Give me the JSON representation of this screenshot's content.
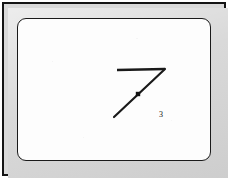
{
  "figure": {
    "kind": "line-diagram",
    "panel_background": "#fdfdfd",
    "frame_color": "#d7d7d7",
    "ink_color": "#1a1a1a",
    "point_label": "3",
    "strokes": [
      {
        "name": "top-horizontal-stroke",
        "from": [
          99,
          51
        ],
        "to": [
          147,
          50
        ],
        "width": 2.6
      },
      {
        "name": "main-diagonal-stroke",
        "from": [
          147,
          50
        ],
        "to": [
          96,
          98
        ],
        "width": 2.2
      }
    ],
    "marker": {
      "name": "point-marker",
      "at": [
        120,
        75
      ],
      "size": 4.4,
      "shape": "square"
    }
  },
  "chart_data": {
    "type": "scatter",
    "title": "",
    "xlabel": "",
    "ylabel": "",
    "annotations": [
      "3"
    ],
    "series": [
      {
        "name": "top-horizontal-stroke",
        "x": [
          99,
          147
        ],
        "y": [
          51,
          50
        ]
      },
      {
        "name": "main-diagonal-stroke",
        "x": [
          147,
          96
        ],
        "y": [
          50,
          98
        ]
      },
      {
        "name": "point-marker",
        "x": [
          120
        ],
        "y": [
          75
        ],
        "labels": [
          "3"
        ]
      }
    ],
    "grid": false,
    "legend": "none"
  }
}
